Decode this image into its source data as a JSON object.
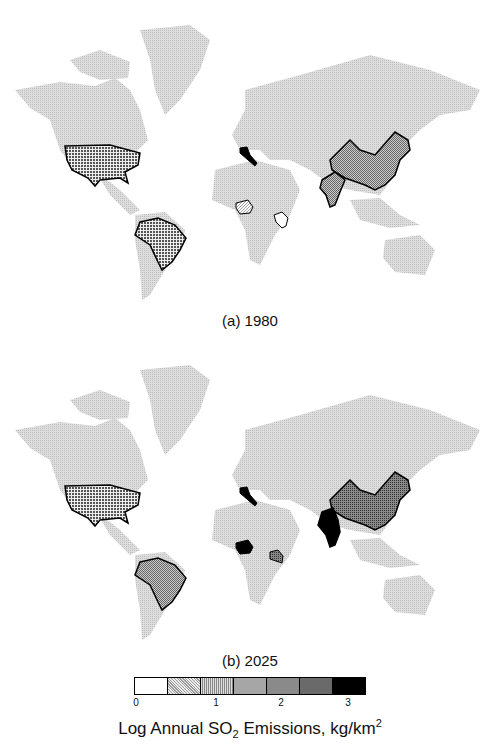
{
  "panels": [
    {
      "caption": "(a) 1980",
      "highlighted_countries": [
        {
          "name": "United States",
          "level": 4
        },
        {
          "name": "Brazil",
          "level": 4
        },
        {
          "name": "Italy",
          "level": 6
        },
        {
          "name": "Nigeria",
          "level": 1
        },
        {
          "name": "Kenya",
          "level": 0
        },
        {
          "name": "China",
          "level": 4
        },
        {
          "name": "India",
          "level": 4
        }
      ]
    },
    {
      "caption": "(b) 2025",
      "highlighted_countries": [
        {
          "name": "United States",
          "level": 4
        },
        {
          "name": "Brazil",
          "level": 3
        },
        {
          "name": "Italy",
          "level": 6
        },
        {
          "name": "Nigeria",
          "level": 6
        },
        {
          "name": "Kenya",
          "level": 5
        },
        {
          "name": "China",
          "level": 5
        },
        {
          "name": "India",
          "level": 6
        }
      ]
    }
  ],
  "legend": {
    "title_prefix": "Log Annual SO",
    "title_sub": "2",
    "title_suffix": " Emissions, kg/km",
    "title_sup": "2",
    "ticks": [
      "0",
      "1",
      "2",
      "3"
    ],
    "swatch_colors": [
      "#ffffff",
      "#d8d8d8",
      "#b8b8b8",
      "#a0a0a0",
      "#8a8a8a",
      "#6a6a6a",
      "#000000"
    ]
  },
  "base_land_color": "#cfcfcf"
}
